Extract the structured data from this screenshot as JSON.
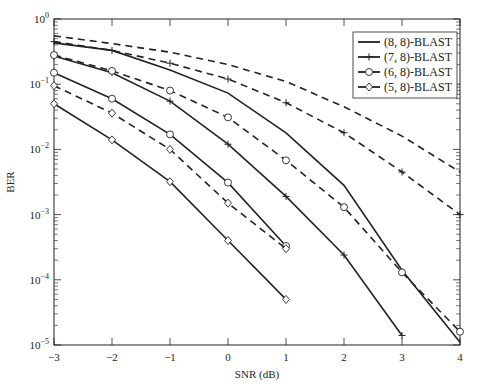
{
  "chart_data": {
    "type": "line",
    "title": "",
    "xlabel": "SNR (dB)",
    "ylabel": "BER",
    "xlim": [
      -3,
      4
    ],
    "ylim": [
      1e-05,
      1
    ],
    "yscale": "log",
    "grid": false,
    "legend_position": "top-right",
    "x": [
      -3,
      -2,
      -1,
      0,
      1,
      2,
      3,
      4
    ],
    "x_tick_labels": [
      "-3",
      "-2",
      "-1",
      "0",
      "1",
      "2",
      "3",
      "4"
    ],
    "y_tick_labels": [
      {
        "base": "10",
        "exp": "0"
      },
      {
        "base": "10",
        "exp": "-1"
      },
      {
        "base": "10",
        "exp": "-2"
      },
      {
        "base": "10",
        "exp": "-3"
      },
      {
        "base": "10",
        "exp": "-4"
      },
      {
        "base": "10",
        "exp": "-5"
      }
    ],
    "series": [
      {
        "name": "(8, 8)-BLAST",
        "style": "solid",
        "marker": "none",
        "x": [
          -3,
          -2,
          -1,
          0,
          1,
          2,
          3,
          4
        ],
        "values": [
          0.43,
          0.33,
          0.165,
          0.073,
          0.018,
          0.0028,
          0.00014,
          1.1e-05
        ]
      },
      {
        "name": "(8, 8)-BLAST",
        "style": "dashed",
        "marker": "none",
        "x": [
          -3,
          -2,
          -1,
          0,
          1,
          2,
          3,
          4
        ],
        "values": [
          0.55,
          0.42,
          0.31,
          0.2,
          0.11,
          0.045,
          0.016,
          0.0045
        ]
      },
      {
        "name": "(7, 8)-BLAST",
        "style": "solid",
        "marker": "plus",
        "x": [
          -3,
          -2,
          -1,
          0,
          1,
          2,
          3
        ],
        "values": [
          0.27,
          0.15,
          0.055,
          0.012,
          0.0019,
          0.00024,
          1.4e-05
        ]
      },
      {
        "name": "(7, 8)-BLAST",
        "style": "dashed",
        "marker": "plus",
        "x": [
          -3,
          -2,
          -1,
          0,
          1,
          2,
          3,
          4
        ],
        "values": [
          0.45,
          0.33,
          0.21,
          0.12,
          0.052,
          0.018,
          0.0045,
          0.001
        ]
      },
      {
        "name": "(6, 8)-BLAST",
        "style": "solid",
        "marker": "circle",
        "x": [
          -3,
          -2,
          -1,
          0,
          1
        ],
        "values": [
          0.15,
          0.06,
          0.017,
          0.0031,
          0.00033
        ]
      },
      {
        "name": "(6, 8)-BLAST",
        "style": "dashed",
        "marker": "circle",
        "x": [
          -3,
          -2,
          -1,
          0,
          1,
          2,
          3,
          4
        ],
        "values": [
          0.28,
          0.16,
          0.08,
          0.031,
          0.0068,
          0.0013,
          0.00013,
          1.6e-05
        ]
      },
      {
        "name": "(5, 8)-BLAST",
        "style": "solid",
        "marker": "diamond",
        "x": [
          -3,
          -2,
          -1,
          0,
          1
        ],
        "values": [
          0.05,
          0.014,
          0.0032,
          0.0004,
          5e-05
        ]
      },
      {
        "name": "(5, 8)-BLAST",
        "style": "dashed",
        "marker": "diamond",
        "x": [
          -3,
          -2,
          -1,
          0,
          1
        ],
        "values": [
          0.095,
          0.036,
          0.01,
          0.0015,
          0.0003
        ]
      }
    ],
    "legend": [
      {
        "label": "(8, 8)-BLAST",
        "marker": "none"
      },
      {
        "label": "(7, 8)-BLAST",
        "marker": "plus"
      },
      {
        "label": "(6, 8)-BLAST",
        "marker": "circle"
      },
      {
        "label": "(5, 8)-BLAST",
        "marker": "diamond"
      }
    ]
  }
}
